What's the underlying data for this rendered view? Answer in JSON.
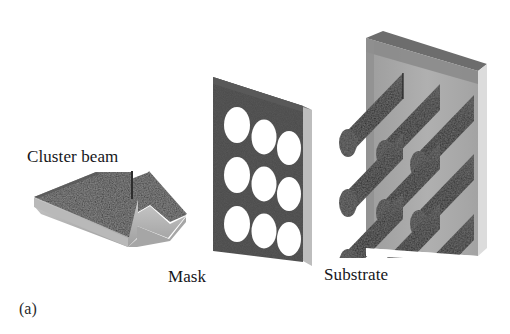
{
  "figure": {
    "caption": "(a)",
    "background_color": "#ffffff",
    "labels": {
      "cluster_beam": "Cluster beam",
      "mask": "Mask",
      "substrate": "Substrate"
    },
    "components": {
      "beam_arrow": {
        "name": "cluster beam arrow",
        "description": "3D block arrow pointing right toward the mask",
        "top_face_color": "#3a3a3a",
        "front_face_color": "#b4b4b4",
        "side_face_color": "#8e8e8e",
        "texture": "speckled"
      },
      "mask": {
        "name": "mask plate",
        "description": "dark perforated plate in perspective",
        "plate_color": "#4c4c4c",
        "edge_color": "#7d7d7d",
        "hole_color": "#ffffff",
        "hole_count": 9,
        "hole_rows": 3,
        "hole_columns": 3
      },
      "substrate": {
        "name": "substrate plate with deposited pillars",
        "description": "light gray plate carrying nine dark cylindrical deposits",
        "plate_color": "#a9a9a9",
        "plate_shadow_color": "#7c7c7c",
        "plate_edge_color": "#d8d8d8",
        "pillar_color": "#2f2f2f",
        "pillar_cap_color": "#464646",
        "pillar_count": 9,
        "pillar_rows": 3,
        "pillar_columns": 3
      }
    }
  }
}
